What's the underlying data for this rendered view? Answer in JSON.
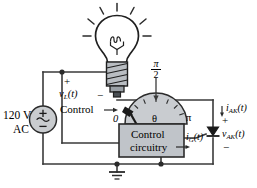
{
  "figure": {
    "type": "circuit-schematic"
  },
  "colors": {
    "wire": "#3a3a3a",
    "box_fill": "#c0c4c9",
    "box_stroke": "#2b2b2b",
    "bulb_base_fill": "#b9bdc2",
    "source_fill": "#c9cccf",
    "dial_fill": "#c9ccd0",
    "text": "#000000",
    "knob": "#1a1a1a"
  },
  "source": {
    "line1": "120 V",
    "line2": "AC",
    "plus": "+",
    "minus": "−",
    "wave": "sine-wave"
  },
  "lamp": {
    "voltage_label": "v",
    "voltage_sub": "L",
    "voltage_arg": "(t)",
    "polarity_plus": "+",
    "polarity_minus": "−",
    "icon": "light-bulb-icon"
  },
  "control": {
    "knob_label": "Control",
    "arrow": "→",
    "box_line1": "Control",
    "box_line2": "circuitry"
  },
  "dial": {
    "tick_start": "0",
    "tick_mid": "θ",
    "tick_end": "π",
    "top_numerator": "π",
    "top_denominator": "2"
  },
  "thyristor": {
    "anode_current": "i",
    "anode_current_sub": "AK",
    "anode_current_arg": "(t)",
    "gate_current": "i",
    "gate_current_sub": "G",
    "gate_current_arg": "(t)",
    "voltage": "v",
    "voltage_sub": "AK",
    "voltage_arg": "(t)",
    "plus": "+",
    "minus": "−",
    "symbol": "thyristor-scr-icon"
  },
  "ground": {
    "symbol": "ground-icon"
  }
}
